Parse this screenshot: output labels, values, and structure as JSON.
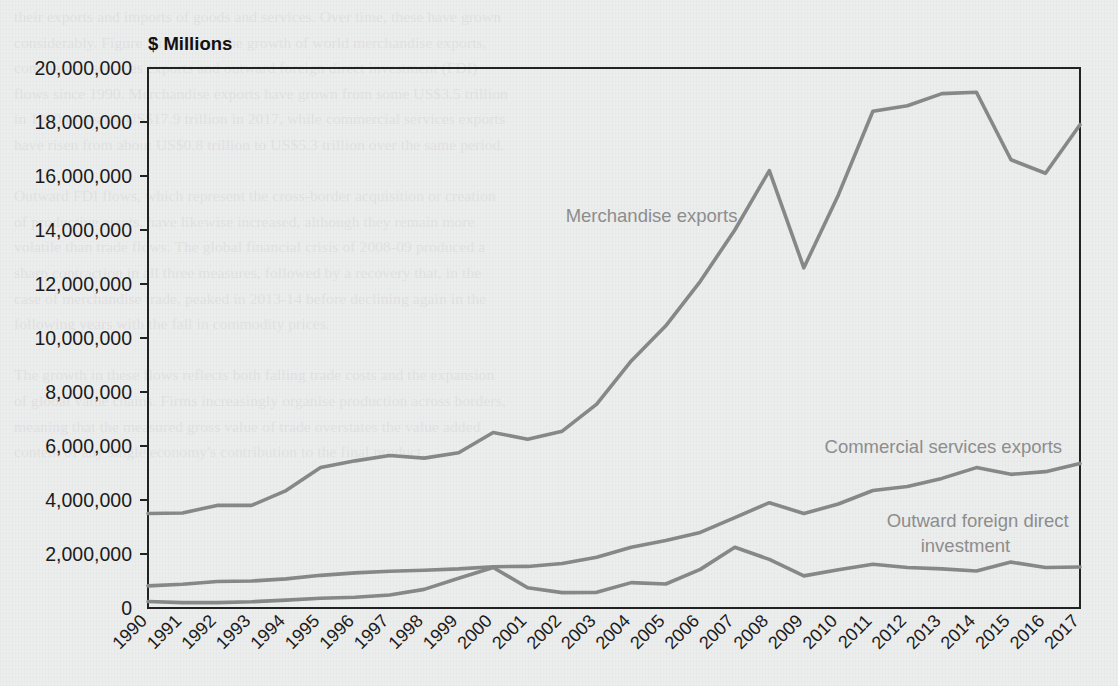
{
  "figure": {
    "background_color": "#eceded",
    "line_color": "#878787",
    "axis_color": "#222222",
    "label_color": "#8d8d8d",
    "showthrough_text": "their exports and imports of goods and services. Over time, these have grown\nconsiderably. Figure 1 illustrates the growth of world merchandise exports,\ncommercial services exports and outward foreign direct investment (FDI)\nflows since 1990. Merchandise exports have grown from some US$3.5 trillion\nin 1990 to nearly US$17.9 trillion in 2017, while commercial services exports\nhave risen from about US$0.8 trillion to US$5.3 trillion over the same period.\n\nOutward FDI flows, which represent the cross-border acquisition or creation\nof productive assets, have likewise increased, although they remain more\nvolatile than trade flows. The global financial crisis of 2008-09 produced a\nsharp contraction in all three measures, followed by a recovery that, in the\ncase of merchandise trade, peaked in 2013-14 before declining again in the\nfollowing years with the fall in commodity prices.\n\nThe growth in these flows reflects both falling trade costs and the expansion\nof global value chains. Firms increasingly organise production across borders,\nmeaning that the measured gross value of trade overstates the value added\ncontent of any single economy's contribution to the final product."
  },
  "chart_data": {
    "type": "line",
    "title": "",
    "xlabel": "",
    "ylabel": "$ Millions",
    "ylim": [
      0,
      20000000
    ],
    "ytick_values": [
      0,
      2000000,
      4000000,
      6000000,
      8000000,
      10000000,
      12000000,
      14000000,
      16000000,
      18000000,
      20000000
    ],
    "ytick_labels": [
      "0",
      "2,000,000",
      "4,000,000",
      "6,000,000",
      "8,000,000",
      "10,000,000",
      "12,000,000",
      "14,000,000",
      "16,000,000",
      "18,000,000",
      "20,000,000"
    ],
    "grid": false,
    "legend_position": "inline-annotations",
    "categories": [
      "1990",
      "1991",
      "1992",
      "1993",
      "1994",
      "1995",
      "1996",
      "1997",
      "1998",
      "1999",
      "2000",
      "2001",
      "2002",
      "2003",
      "2004",
      "2005",
      "2006",
      "2007",
      "2008",
      "2009",
      "2010",
      "2011",
      "2012",
      "2013",
      "2014",
      "2015",
      "2016",
      "2017"
    ],
    "series": [
      {
        "name": "Merchandise exports",
        "label_x_year": 2002.1,
        "label_y_value": 14300000,
        "label_anchor": "start",
        "values": [
          3500000,
          3520000,
          3800000,
          3800000,
          4350000,
          5200000,
          5450000,
          5650000,
          5550000,
          5750000,
          6500000,
          6250000,
          6550000,
          7550000,
          9150000,
          10450000,
          12100000,
          14000000,
          16200000,
          12600000,
          15300000,
          18400000,
          18600000,
          19050000,
          19100000,
          16600000,
          16100000,
          17900000
        ]
      },
      {
        "name": "Commercial services exports",
        "label_x_year": 2009.6,
        "label_y_value": 5750000,
        "label_anchor": "start",
        "values": [
          820000,
          880000,
          980000,
          1000000,
          1080000,
          1210000,
          1300000,
          1360000,
          1400000,
          1450000,
          1530000,
          1540000,
          1650000,
          1880000,
          2250000,
          2500000,
          2800000,
          3350000,
          3900000,
          3500000,
          3850000,
          4350000,
          4500000,
          4800000,
          5200000,
          4950000,
          5050000,
          5350000
        ]
      },
      {
        "name": "Outward foreign direct investment",
        "label_x_year": 2011.4,
        "label_y_value": 3000000,
        "label_anchor": "start",
        "label_line2": "investment",
        "values": [
          240000,
          200000,
          200000,
          230000,
          290000,
          360000,
          400000,
          480000,
          690000,
          1100000,
          1500000,
          750000,
          570000,
          580000,
          940000,
          890000,
          1430000,
          2250000,
          1800000,
          1190000,
          1420000,
          1620000,
          1500000,
          1450000,
          1370000,
          1700000,
          1500000,
          1520000
        ]
      }
    ]
  }
}
